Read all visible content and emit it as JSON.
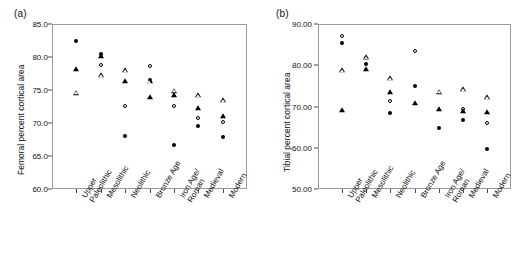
{
  "figure": {
    "panels": [
      {
        "label": "(a)",
        "ylabel": "Femoral percent cortical area"
      },
      {
        "label": "(b)",
        "ylabel": "Tibial percent cortical area"
      }
    ]
  },
  "chart_data": [
    {
      "type": "scatter",
      "panel": "(a)",
      "title": "",
      "xlabel": "",
      "ylabel": "Femoral percent cortical area",
      "ylim": [
        60.0,
        85.0
      ],
      "yticks": [
        60.0,
        65.0,
        70.0,
        75.0,
        80.0,
        85.0
      ],
      "ytick_labels": [
        "60.0",
        "65.0",
        "70.0",
        "75.0",
        "80.0",
        "85.0"
      ],
      "grid": false,
      "legend": "none",
      "categories": [
        "Upper\nPaleolithic",
        "Mesolithic",
        "Neolithic",
        "Bronze Age",
        "Iron Age/\nRoman",
        "Medieval",
        "Modern"
      ],
      "series": [
        {
          "name": "filled-circle",
          "marker": "filled-circle",
          "values": [
            82.4,
            80.4,
            68.0,
            76.5,
            66.6,
            69.5,
            67.9
          ]
        },
        {
          "name": "filled-triangle",
          "marker": "filled-triangle",
          "values": [
            78.2,
            80.2,
            76.4,
            74.0,
            74.3,
            72.3,
            71.1
          ]
        },
        {
          "name": "open-circle",
          "marker": "open-circle",
          "values": [
            null,
            78.8,
            72.6,
            78.6,
            72.6,
            70.8,
            70.2
          ]
        },
        {
          "name": "open-triangle",
          "marker": "open-triangle",
          "values": [
            74.6,
            77.3,
            78.0,
            76.3,
            74.9,
            74.2,
            73.5
          ]
        }
      ]
    },
    {
      "type": "scatter",
      "panel": "(b)",
      "title": "",
      "xlabel": "",
      "ylabel": "Tibial percent cortical area",
      "ylim": [
        50.0,
        90.0
      ],
      "yticks": [
        50.0,
        60.0,
        70.0,
        80.0,
        90.0
      ],
      "ytick_labels": [
        "50.00",
        "60.00",
        "70.00",
        "80.00",
        "90.00"
      ],
      "grid": false,
      "legend": "none",
      "categories": [
        "Upper\nPaleolithic",
        "Mesolithic",
        "Neolithic",
        "Bronze Age",
        "Iron Age/\nRoman",
        "Medieval",
        "Modern"
      ],
      "series": [
        {
          "name": "filled-circle",
          "marker": "filled-circle",
          "values": [
            85.4,
            80.4,
            68.5,
            75.0,
            64.9,
            66.8,
            59.6
          ]
        },
        {
          "name": "filled-triangle",
          "marker": "filled-triangle",
          "values": [
            69.2,
            79.2,
            73.4,
            70.9,
            69.5,
            68.9,
            68.7
          ]
        },
        {
          "name": "open-circle",
          "marker": "open-circle",
          "values": [
            87.0,
            81.8,
            71.3,
            83.5,
            null,
            69.3,
            66.0
          ]
        },
        {
          "name": "open-triangle",
          "marker": "open-triangle",
          "values": [
            78.8,
            81.9,
            76.8,
            null,
            73.6,
            74.2,
            72.2
          ]
        }
      ]
    }
  ]
}
